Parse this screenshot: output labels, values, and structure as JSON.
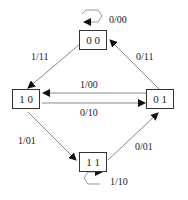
{
  "diagram": {
    "type": "state-transition",
    "states": [
      {
        "id": "s00",
        "label": "0 0"
      },
      {
        "id": "s10",
        "label": "1 0"
      },
      {
        "id": "s01",
        "label": "0 1"
      },
      {
        "id": "s11",
        "label": "1 1"
      }
    ],
    "transitions": [
      {
        "from": "0 0",
        "to": "0 0",
        "label": "0/00"
      },
      {
        "from": "0 0",
        "to": "1 0",
        "label": "1/11"
      },
      {
        "from": "0 1",
        "to": "0 0",
        "label": "0/11"
      },
      {
        "from": "0 1",
        "to": "1 0",
        "label": "1/00"
      },
      {
        "from": "1 0",
        "to": "0 1",
        "label": "0/10"
      },
      {
        "from": "1 0",
        "to": "1 1",
        "label": "1/01"
      },
      {
        "from": "1 1",
        "to": "0 1",
        "label": "0/01"
      },
      {
        "from": "1 1",
        "to": "1 1",
        "label": "1/10"
      }
    ]
  }
}
